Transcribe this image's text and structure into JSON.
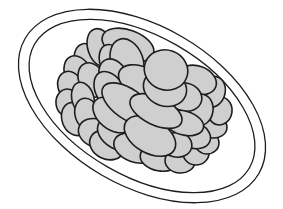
{
  "illustration": {
    "subject": "plate of stacked oval cookies",
    "colors": {
      "background": "#ffffff",
      "stroke": "#1e1e1e",
      "fill": "#cfcfcf"
    },
    "plate": {
      "cx": 142,
      "cy": 106,
      "rotate": 30,
      "outer": {
        "rx": 135,
        "ry": 80
      },
      "inner": {
        "rx": 124,
        "ry": 70
      }
    },
    "cookies": [
      {
        "cx": 88,
        "cy": 62,
        "rx": 13,
        "ry": 19,
        "r": -20
      },
      {
        "cx": 101,
        "cy": 48,
        "rx": 13,
        "ry": 20,
        "r": -20
      },
      {
        "cx": 128,
        "cy": 45,
        "rx": 27,
        "ry": 15,
        "r": 20
      },
      {
        "cx": 78,
        "cy": 73,
        "rx": 13,
        "ry": 18,
        "r": -25
      },
      {
        "cx": 70,
        "cy": 86,
        "rx": 12,
        "ry": 15,
        "r": -20
      },
      {
        "cx": 68,
        "cy": 103,
        "rx": 12,
        "ry": 14,
        "r": -10
      },
      {
        "cx": 75,
        "cy": 119,
        "rx": 13,
        "ry": 17,
        "r": -20
      },
      {
        "cx": 112,
        "cy": 62,
        "rx": 12,
        "ry": 18,
        "r": -20
      },
      {
        "cx": 92,
        "cy": 80,
        "rx": 13,
        "ry": 18,
        "r": -25
      },
      {
        "cx": 83,
        "cy": 99,
        "rx": 11,
        "ry": 17,
        "r": -15
      },
      {
        "cx": 87,
        "cy": 114,
        "rx": 12,
        "ry": 16,
        "r": -15
      },
      {
        "cx": 96,
        "cy": 133,
        "rx": 18,
        "ry": 14,
        "r": 20
      },
      {
        "cx": 107,
        "cy": 145,
        "rx": 18,
        "ry": 14,
        "r": 25
      },
      {
        "cx": 127,
        "cy": 61,
        "rx": 16,
        "ry": 23,
        "r": -20
      },
      {
        "cx": 114,
        "cy": 78,
        "rx": 14,
        "ry": 20,
        "r": -25
      },
      {
        "cx": 110,
        "cy": 91,
        "rx": 14,
        "ry": 21,
        "r": -30
      },
      {
        "cx": 118,
        "cy": 134,
        "rx": 22,
        "ry": 15,
        "r": 30
      },
      {
        "cx": 135,
        "cy": 148,
        "rx": 22,
        "ry": 14,
        "r": 20
      },
      {
        "cx": 160,
        "cy": 158,
        "rx": 20,
        "ry": 13,
        "r": 10
      },
      {
        "cx": 180,
        "cy": 161,
        "rx": 15,
        "ry": 12,
        "r": 5
      },
      {
        "cx": 196,
        "cy": 153,
        "rx": 13,
        "ry": 12,
        "r": 0
      },
      {
        "cx": 207,
        "cy": 143,
        "rx": 12,
        "ry": 11,
        "r": 0
      },
      {
        "cx": 213,
        "cy": 127,
        "rx": 14,
        "ry": 11,
        "r": 5
      },
      {
        "cx": 220,
        "cy": 111,
        "rx": 12,
        "ry": 14,
        "r": 10
      },
      {
        "cx": 212,
        "cy": 92,
        "rx": 13,
        "ry": 16,
        "r": 20
      },
      {
        "cx": 197,
        "cy": 80,
        "rx": 20,
        "ry": 14,
        "r": 20
      },
      {
        "cx": 112,
        "cy": 115,
        "rx": 22,
        "ry": 14,
        "r": 40
      },
      {
        "cx": 193,
        "cy": 135,
        "rx": 18,
        "ry": 13,
        "r": 20
      },
      {
        "cx": 200,
        "cy": 110,
        "rx": 13,
        "ry": 16,
        "r": 10
      },
      {
        "cx": 176,
        "cy": 144,
        "rx": 16,
        "ry": 13,
        "r": 15
      },
      {
        "cx": 185,
        "cy": 97,
        "rx": 17,
        "ry": 14,
        "r": 15
      },
      {
        "cx": 142,
        "cy": 82,
        "rx": 25,
        "ry": 15,
        "r": 25
      },
      {
        "cx": 128,
        "cy": 104,
        "rx": 30,
        "ry": 15,
        "r": 35
      },
      {
        "cx": 168,
        "cy": 120,
        "rx": 18,
        "ry": 13,
        "r": 10
      },
      {
        "cx": 184,
        "cy": 123,
        "rx": 20,
        "ry": 12,
        "r": 15
      },
      {
        "cx": 150,
        "cy": 136,
        "rx": 28,
        "ry": 17,
        "r": 30
      },
      {
        "cx": 156,
        "cy": 111,
        "rx": 28,
        "ry": 14,
        "r": 25
      },
      {
        "cx": 165,
        "cy": 88,
        "rx": 22,
        "ry": 18,
        "r": 20
      },
      {
        "cx": 166,
        "cy": 70,
        "rx": 22,
        "ry": 20,
        "r": 20
      }
    ]
  }
}
